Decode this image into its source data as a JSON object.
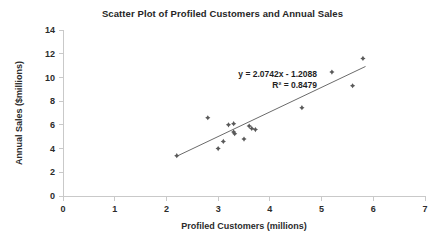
{
  "chart_data": {
    "type": "scatter",
    "title": "Scatter Plot of Profiled Customers and Annual Sales",
    "xlabel": "Profiled Customers (millions)",
    "ylabel": "Annual Sales ($millions)",
    "xlim": [
      0,
      7
    ],
    "ylim": [
      0,
      14
    ],
    "xticks": [
      0,
      1,
      2,
      3,
      4,
      5,
      6,
      7
    ],
    "yticks": [
      0,
      2,
      4,
      6,
      8,
      10,
      12,
      14
    ],
    "xtick_labels": [
      "0",
      "1",
      "2",
      "3",
      "4",
      "5",
      "6",
      "7"
    ],
    "ytick_labels": [
      "0",
      "2",
      "4",
      "6",
      "8",
      "10",
      "12",
      "14"
    ],
    "grid": false,
    "legend": false,
    "marker_style": "diamond-cross",
    "marker_color": "#595959",
    "trendline_color": "#6b6b6b",
    "points": [
      {
        "x": 2.2,
        "y": 3.4
      },
      {
        "x": 2.8,
        "y": 6.6
      },
      {
        "x": 3.0,
        "y": 4.0
      },
      {
        "x": 3.1,
        "y": 4.6
      },
      {
        "x": 3.2,
        "y": 6.0
      },
      {
        "x": 3.3,
        "y": 6.1
      },
      {
        "x": 3.3,
        "y": 5.4
      },
      {
        "x": 3.32,
        "y": 5.25
      },
      {
        "x": 3.5,
        "y": 4.8
      },
      {
        "x": 3.6,
        "y": 5.9
      },
      {
        "x": 3.65,
        "y": 5.7
      },
      {
        "x": 3.72,
        "y": 5.6
      },
      {
        "x": 4.62,
        "y": 7.45
      },
      {
        "x": 5.2,
        "y": 10.45
      },
      {
        "x": 5.6,
        "y": 9.3
      },
      {
        "x": 5.8,
        "y": 11.6
      }
    ],
    "trendline": {
      "slope": 2.0742,
      "intercept": -1.2088,
      "x_start": 2.2,
      "x_end": 5.85
    },
    "annotations": {
      "equation": "y = 2.0742x - 1.2088",
      "r_squared": "R² = 0.8479"
    }
  }
}
